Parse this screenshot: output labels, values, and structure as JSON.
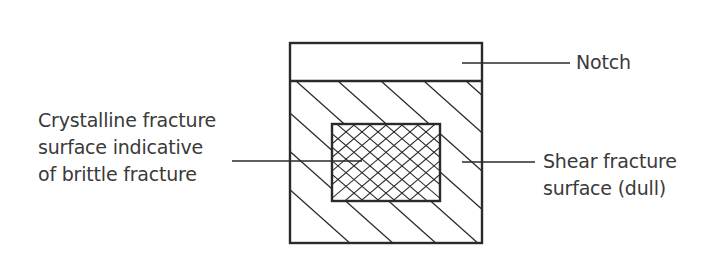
{
  "diagram": {
    "labels": {
      "notch": "Notch",
      "crystalline": [
        "Crystalline fracture",
        "surface indicative",
        "of brittle fracture"
      ],
      "shear": [
        "Shear fracture",
        "surface (dull)"
      ]
    },
    "colors": {
      "stroke": "#2a2a2a",
      "text": "#3a3a3a",
      "background": "#ffffff"
    },
    "geometry": {
      "outer_box": {
        "x": 290,
        "y": 43,
        "w": 192,
        "h": 200
      },
      "notch_line_y": 81,
      "inner_box": {
        "x": 332,
        "y": 124,
        "w": 108,
        "h": 77
      }
    }
  }
}
